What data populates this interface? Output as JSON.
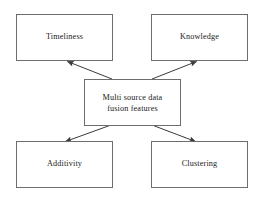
{
  "diagram": {
    "type": "hub-and-spoke-block-diagram",
    "title": "",
    "canvas": {
      "width": 262,
      "height": 198,
      "background": "#ffffff"
    },
    "style": {
      "box_border_color": "#6d6d6d",
      "box_fill": "#ffffff",
      "text_color": "#1b1b1b",
      "arrow_color": "#3a3a3a"
    },
    "center_node": {
      "id": "center",
      "label": "Multi source data\nfusion features"
    },
    "nodes": [
      {
        "id": "timeliness",
        "label": "Timeliness",
        "position": "top-left"
      },
      {
        "id": "knowledge",
        "label": "Knowledge",
        "position": "top-right"
      },
      {
        "id": "additivity",
        "label": "Additivity",
        "position": "bottom-left"
      },
      {
        "id": "clustering",
        "label": "Clustering",
        "position": "bottom-right"
      }
    ],
    "edges": [
      {
        "from": "center",
        "to": "timeliness",
        "arrowhead": "target"
      },
      {
        "from": "center",
        "to": "knowledge",
        "arrowhead": "target"
      },
      {
        "from": "center",
        "to": "additivity",
        "arrowhead": "target"
      },
      {
        "from": "center",
        "to": "clustering",
        "arrowhead": "target"
      }
    ]
  }
}
